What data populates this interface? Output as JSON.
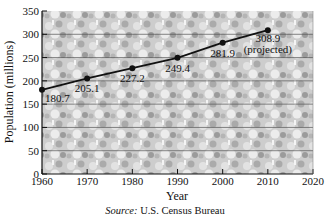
{
  "chart_data": {
    "type": "line",
    "title": "",
    "xlabel": "Year",
    "ylabel": "Population (millions)",
    "x": [
      1960,
      1970,
      1980,
      1990,
      2000,
      2010
    ],
    "series": [
      {
        "name": "U.S. Population",
        "values": [
          180.7,
          205.1,
          227.2,
          249.4,
          281.9,
          308.9
        ],
        "labels": [
          "180.7",
          "205.1",
          "227.2",
          "249.4",
          "281.9",
          "308.9"
        ]
      }
    ],
    "annotations": [
      {
        "x": 2010,
        "text": "(projected)"
      }
    ],
    "xlim": [
      1960,
      2020
    ],
    "ylim": [
      0,
      350
    ],
    "xticks": [
      1960,
      1970,
      1980,
      1990,
      2000,
      2010,
      2020
    ],
    "yticks": [
      0,
      50,
      100,
      150,
      200,
      250,
      300,
      350
    ],
    "grid": "horizontal",
    "legend": "none",
    "background": "photo of crowd (grayscale)"
  },
  "labels": {
    "xlabel": "Year",
    "ylabel": "Population (millions)",
    "projected": "(projected)",
    "source_prefix": "Source:",
    "source_text": "U.S. Census Bureau"
  },
  "colors": {
    "line": "#111111",
    "grid": "#555555",
    "background_photo": "#b8b8b8"
  }
}
